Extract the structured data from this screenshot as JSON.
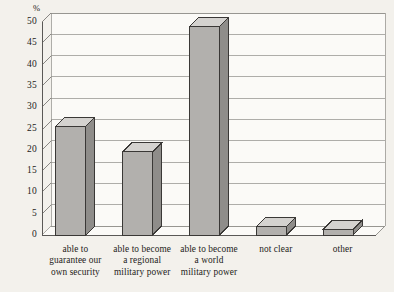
{
  "chart_data": {
    "type": "bar",
    "title": "",
    "subtitle": "",
    "xlabel": "",
    "ylabel": "%",
    "ylim": [
      0,
      50
    ],
    "ytick_step": 5,
    "yticks": [
      0,
      5,
      10,
      15,
      20,
      25,
      30,
      35,
      40,
      45,
      50
    ],
    "ytick_labels": [
      "0",
      "5",
      "10",
      "15",
      "20",
      "25",
      "30",
      "35",
      "40",
      "45",
      "50"
    ],
    "grid": true,
    "grid_axis": "y",
    "legend": false,
    "legend_position": "none",
    "style": "3d-bar",
    "categories": [
      "able to guarantee our own security",
      "able to become a regional military power",
      "able to become a world military power",
      "not clear",
      "other"
    ],
    "category_lines": [
      [
        "able to",
        "guarantee our",
        "own security"
      ],
      [
        "able to become",
        "a regional",
        "military power"
      ],
      [
        "able to become",
        "a world",
        "military power"
      ],
      [
        "not clear"
      ],
      [
        "other"
      ]
    ],
    "values": [
      25.5,
      19.5,
      49,
      2,
      1.3
    ],
    "annotations": []
  },
  "colors": {
    "background": "#f3f1ec",
    "plot_background": "#fbfaf7",
    "bar_front": "#b2b0ad",
    "bar_side": "#8f8d8a",
    "bar_top": "#d4d2cf",
    "bar_edge": "#3a3836",
    "grid_line": "#8d8b88",
    "axis_line": "#5a5856",
    "text": "#1d1b19"
  }
}
